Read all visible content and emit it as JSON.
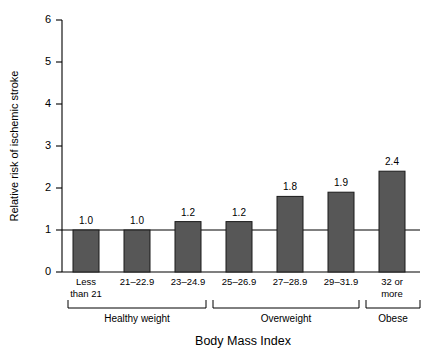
{
  "chart_data": {
    "type": "bar",
    "title": "",
    "xlabel": "Body Mass Index",
    "ylabel": "Relative risk of ischemic stroke",
    "categories": [
      "Less than 21",
      "21–22.9",
      "23–24.9",
      "25–26.9",
      "27–28.9",
      "29–31.9",
      "32 or more"
    ],
    "category_lines": [
      [
        "Less",
        "than 21"
      ],
      [
        "21–22.9"
      ],
      [
        "23–24.9"
      ],
      [
        "25–26.9"
      ],
      [
        "27–28.9"
      ],
      [
        "29–31.9"
      ],
      [
        "32 or",
        "more"
      ]
    ],
    "values": [
      1.0,
      1.0,
      1.2,
      1.2,
      1.8,
      1.9,
      2.4
    ],
    "value_labels": [
      "1.0",
      "1.0",
      "1.2",
      "1.2",
      "1.8",
      "1.9",
      "2.4"
    ],
    "ylim": [
      0,
      6
    ],
    "yticks": [
      0,
      1,
      2,
      3,
      4,
      5,
      6
    ],
    "ytick_labels": [
      "0",
      "1",
      "2",
      "3",
      "4",
      "5",
      "6"
    ],
    "grid": false,
    "legend": "none",
    "reference_line": {
      "value": 1,
      "label": ""
    },
    "groups": [
      {
        "label": "Healthy weight",
        "first_index": 0,
        "last_index": 2
      },
      {
        "label": "Overweight",
        "first_index": 3,
        "last_index": 5
      },
      {
        "label": "Obese",
        "first_index": 6,
        "last_index": 6
      }
    ],
    "colors": {
      "bar_fill": "#575757",
      "bar_stroke": "#1a1a1a",
      "axis": "#000000",
      "background": "#ffffff",
      "text": "#000000"
    }
  }
}
